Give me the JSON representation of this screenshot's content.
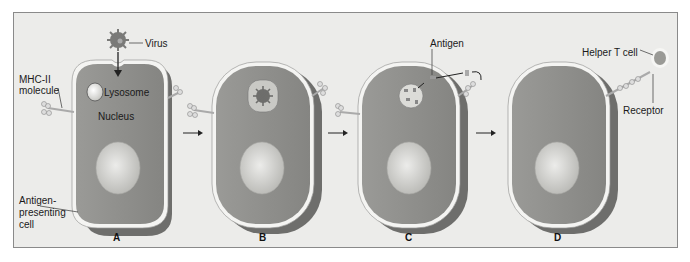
{
  "figure": {
    "panels": [
      {
        "letter": "A"
      },
      {
        "letter": "B"
      },
      {
        "letter": "C"
      },
      {
        "letter": "D"
      }
    ],
    "labels": {
      "virus": "Virus",
      "mhc_line1": "MHC-II",
      "mhc_line2": "molecule",
      "lysosome": "Lysosome",
      "nucleus": "Nucleus",
      "apc_line1": "Antigen-",
      "apc_line2": "presenting",
      "apc_line3": "cell",
      "antigen": "Antigen",
      "helper_t": "Helper T cell",
      "receptor": "Receptor"
    },
    "colors": {
      "background": "#ececea",
      "cell_body": "#8f8f8c",
      "cell_shadow": "#6e6e6c",
      "membrane": "#f4f4f2",
      "nucleus": "#d4d4d0",
      "virus": "#7a7a78",
      "helper_t": "#9a9a96"
    }
  }
}
